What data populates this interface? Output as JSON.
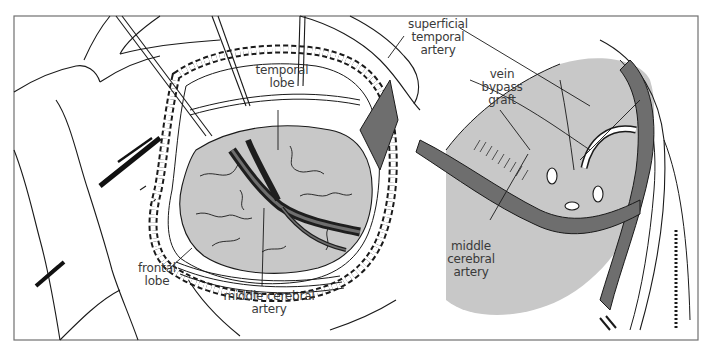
{
  "figure": {
    "type": "surgical illustration",
    "panels": [
      {
        "id": "left",
        "description": "craniotomy exposing brain surface",
        "labels": [
          {
            "key": "temporal_lobe",
            "lines": [
              "temporal",
              "lobe"
            ]
          },
          {
            "key": "frontal_lobe",
            "lines": [
              "frontal",
              "lobe"
            ]
          },
          {
            "key": "middle_cerebral_artery",
            "lines": [
              "middle cerebral",
              "artery"
            ]
          }
        ]
      },
      {
        "id": "right",
        "description": "close-up of vein bypass graft anastomosis",
        "labels": [
          {
            "key": "superficial_temporal_artery",
            "lines": [
              "superficial",
              "temporal",
              "artery"
            ]
          },
          {
            "key": "vein_bypass_graft",
            "lines": [
              "vein",
              "bypass",
              "graft"
            ]
          },
          {
            "key": "middle_cerebral_artery",
            "lines": [
              "middle",
              "cerebral",
              "artery"
            ]
          }
        ]
      }
    ]
  },
  "labels": {
    "temporal_lobe": {
      "line1": "temporal",
      "line2": "lobe"
    },
    "frontal_lobe": {
      "line1": "frontal",
      "line2": "lobe"
    },
    "mca_left": {
      "line1": "middle cerebral",
      "line2": "artery"
    },
    "sta": {
      "line1": "superficial",
      "line2": "temporal",
      "line3": "artery"
    },
    "vein_graft": {
      "line1": "vein",
      "line2": "bypass",
      "line3": "graft"
    },
    "mca_right": {
      "line1": "middle",
      "line2": "cerebral",
      "line3": "artery"
    }
  },
  "colors": {
    "frame": "#707070",
    "line": "#1a1a1a",
    "brain": "#c8c8c8",
    "vessel": "#6e6e6e",
    "vessel_dark": "#1e1e1e",
    "label": "#3a3a3a"
  }
}
